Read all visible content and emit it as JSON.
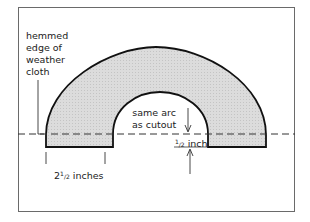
{
  "diagram": {
    "labels": {
      "hemmed_line1": "hemmed",
      "hemmed_line2": "edge of",
      "hemmed_line3": "weather",
      "hemmed_line4": "cloth",
      "arc_line1": "same arc",
      "arc_line2": "as cutout",
      "width_whole": "2",
      "width_num": "1",
      "width_den": "2",
      "width_unit": " inches",
      "gap_num": "1",
      "gap_den": "2",
      "gap_unit": " inch"
    },
    "colors": {
      "fill": "#d9d9d9",
      "stroke": "#111111",
      "frame": "#6a6a6a"
    }
  }
}
